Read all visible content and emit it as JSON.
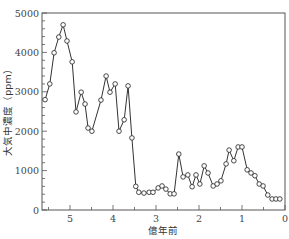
{
  "chart_data": {
    "type": "line",
    "title": "",
    "xlabel": "億年前",
    "ylabel": "大気中濃度（ppm）",
    "xlim": [
      5.7,
      0
    ],
    "ylim": [
      0,
      5000
    ],
    "x_ticks": [
      5,
      4,
      3,
      2,
      1,
      0
    ],
    "y_ticks": [
      0,
      1000,
      2000,
      3000,
      4000,
      5000
    ],
    "x_minor_step": 0.5,
    "y_minor_step": 200,
    "grid": false,
    "frame": "box",
    "marker": "open-circle",
    "series": [
      {
        "name": "CO2",
        "x": [
          5.58,
          5.47,
          5.37,
          5.26,
          5.16,
          5.07,
          4.95,
          4.86,
          4.74,
          4.65,
          4.58,
          4.49,
          4.28,
          4.16,
          4.07,
          3.95,
          3.86,
          3.74,
          3.65,
          3.56,
          3.47,
          3.4,
          3.28,
          3.16,
          3.07,
          2.95,
          2.86,
          2.77,
          2.67,
          2.58,
          2.47,
          2.37,
          2.26,
          2.16,
          2.07,
          1.98,
          1.88,
          1.79,
          1.67,
          1.58,
          1.49,
          1.37,
          1.3,
          1.19,
          1.09,
          1.0,
          0.88,
          0.79,
          0.7,
          0.6,
          0.51,
          0.4,
          0.3,
          0.21,
          0.12
        ],
        "values": [
          2800,
          3200,
          3990,
          4390,
          4700,
          4290,
          3760,
          2490,
          2990,
          2690,
          2080,
          2000,
          2790,
          3400,
          2990,
          3200,
          2000,
          2290,
          3150,
          1830,
          600,
          450,
          430,
          450,
          450,
          560,
          610,
          530,
          410,
          410,
          1420,
          840,
          890,
          590,
          890,
          660,
          1120,
          940,
          610,
          660,
          740,
          1170,
          1520,
          1250,
          1600,
          1600,
          1020,
          940,
          870,
          660,
          610,
          380,
          280,
          280,
          280
        ]
      }
    ]
  }
}
